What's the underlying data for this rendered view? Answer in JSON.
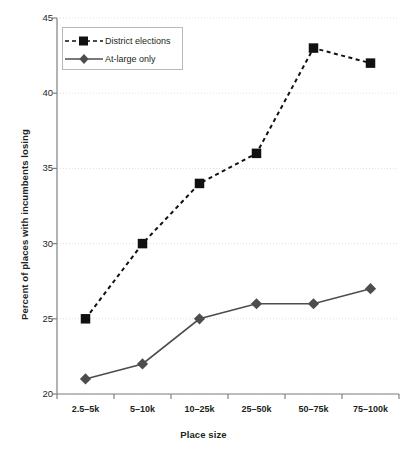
{
  "chart_data": {
    "type": "line",
    "title": "",
    "xlabel": "Place size",
    "ylabel": "Percent of places with incumbents losing",
    "categories": [
      "2.5–5k",
      "5–10k",
      "10–25k",
      "25–50k",
      "50–75k",
      "75–100k"
    ],
    "ylim": [
      20,
      45
    ],
    "yticks": [
      20,
      25,
      30,
      35,
      40,
      45
    ],
    "ytick_labels": [
      "20",
      "25",
      "30",
      "35",
      "40",
      "45"
    ],
    "grid": "horizontal-dotted",
    "legend_position": "top-left-inside",
    "series": [
      {
        "name": "District elections",
        "values": [
          25,
          30,
          34,
          36,
          43,
          42
        ],
        "marker": "square",
        "line_style": "dashed",
        "color": "#111111"
      },
      {
        "name": "At-large only",
        "values": [
          21,
          22,
          25,
          26,
          26,
          27
        ],
        "marker": "diamond",
        "line_style": "solid",
        "color": "#4d4d4d"
      }
    ]
  },
  "legend": {
    "items": [
      {
        "label": "District elections"
      },
      {
        "label": "At-large only"
      }
    ]
  },
  "colors": {
    "series_district": "#111111",
    "series_atlarge": "#4d4d4d",
    "axis": "#808080",
    "grid": "#e3dede",
    "text": "#231f20",
    "legend_border": "#b9b9b9",
    "background": "#ffffff"
  }
}
